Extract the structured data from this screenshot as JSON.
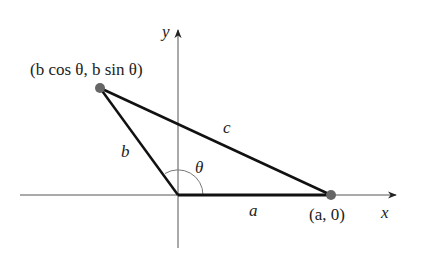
{
  "diagram": {
    "axes": {
      "x_label": "x",
      "y_label": "y"
    },
    "points": {
      "B": {
        "label": "(b cos θ, b sin θ)"
      },
      "A": {
        "label": "(a, 0)"
      }
    },
    "sides": {
      "a": "a",
      "b": "b",
      "c": "c"
    },
    "angle": "θ",
    "colors": {
      "axis": "#555555",
      "side": "#111111",
      "point": "#666666",
      "arc": "#777777"
    }
  }
}
